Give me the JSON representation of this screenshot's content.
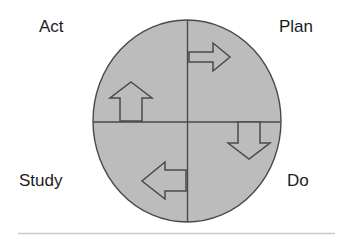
{
  "diagram": {
    "name": "PDSA cycle (Plan-Do-Study-Act) diagram",
    "type": "cycle-wheel",
    "labels": {
      "act": "Act",
      "plan": "Plan",
      "study": "Study",
      "do": "Do"
    },
    "quadrants": [
      {
        "position": "top-left",
        "label": "Act",
        "arrow": "arrow-up"
      },
      {
        "position": "top-right",
        "label": "Plan",
        "arrow": "arrow-right"
      },
      {
        "position": "bottom-right",
        "label": "Do",
        "arrow": "arrow-down"
      },
      {
        "position": "bottom-left",
        "label": "Study",
        "arrow": "arrow-left"
      }
    ],
    "arrow_icons": {
      "up": "arrow-up-icon",
      "right": "arrow-right-icon",
      "down": "arrow-down-icon",
      "left": "arrow-left-icon"
    },
    "colors": {
      "wheel_fill": "#bcbcbc",
      "wheel_stroke": "#4a4a4a",
      "divider_stroke": "#4a4a4a",
      "arrow_fill": "#bcbcbc",
      "arrow_stroke": "#4a4a4a",
      "label_text": "#1c1c1c",
      "footer_rule": "#c9c9c9",
      "background": "#ffffff"
    },
    "geometry": {
      "ellipse_center_x": 187,
      "ellipse_center_y": 121,
      "ellipse_radius_x": 94,
      "ellipse_radius_y": 101,
      "vertical_divider_x": 187,
      "horizontal_divider_y": 122
    },
    "footer_rule": {
      "name": "footer-divider",
      "x1": 18,
      "x2": 335,
      "y": 233
    }
  }
}
